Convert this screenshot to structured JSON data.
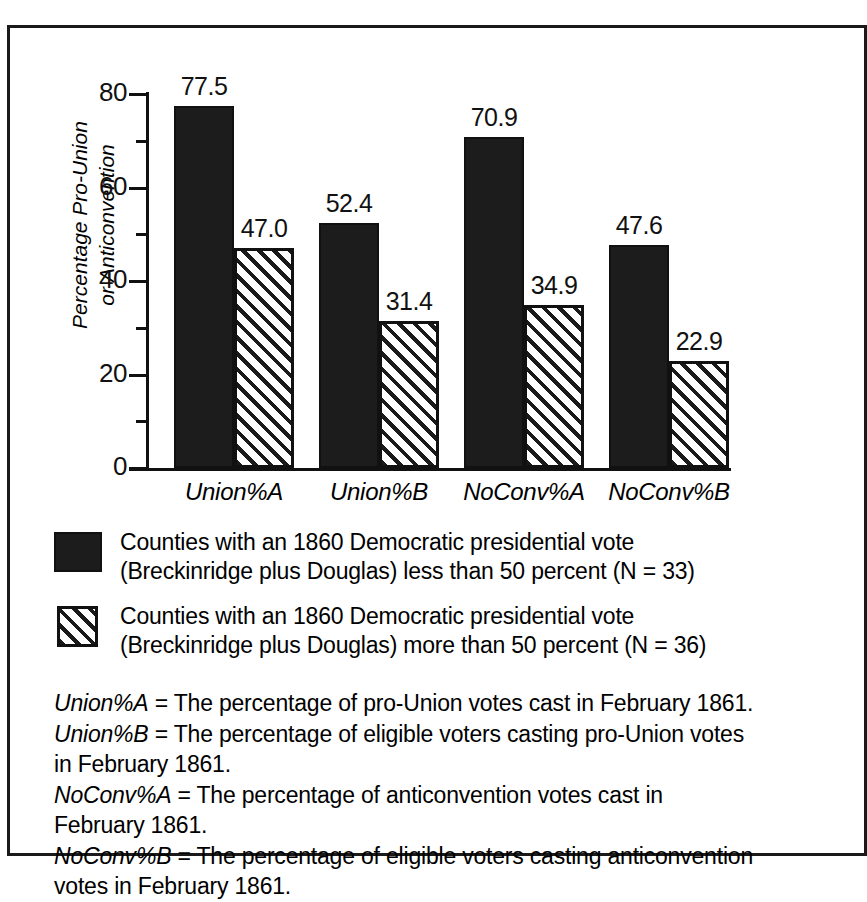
{
  "chart_data": {
    "type": "bar",
    "title": "",
    "xlabel": "",
    "ylabel": "Percentage Pro-Union or Anticonvention",
    "ylim": [
      0,
      80
    ],
    "ytick_values": [
      0,
      20,
      40,
      60,
      80
    ],
    "yticks": [
      "0",
      "20",
      "40",
      "60",
      "80"
    ],
    "yminor_ticks": [
      10,
      30,
      50,
      70
    ],
    "grid": false,
    "legend_position": "below-plot",
    "categories": [
      "Union%A",
      "Union%B",
      "NoConv%A",
      "NoConv%B"
    ],
    "series": [
      {
        "name": "Counties with an 1860 Democratic presidential vote (Breckinridge plus Douglas) less than 50 percent (N = 33)",
        "fill": "solid-black",
        "values": [
          77.5,
          52.4,
          70.9,
          47.6
        ],
        "labels": [
          "77.5",
          "52.4",
          "70.9",
          "47.6"
        ]
      },
      {
        "name": "Counties with an 1860 Democratic presidential vote (Breckinridge plus Douglas) more than 50 percent (N = 36)",
        "fill": "diagonal-hatch",
        "values": [
          47.0,
          31.4,
          34.9,
          22.9
        ],
        "labels": [
          "47.0",
          "31.4",
          "34.9",
          "22.9"
        ]
      }
    ]
  },
  "axis": {
    "y_title_line1": "Percentage Pro-Union",
    "y_title_line2": "or Anticonvention"
  },
  "legend": {
    "items": [
      {
        "swatch": "solid-black",
        "line1": "Counties with an 1860 Democratic presidential vote (Breckinridge plus",
        "line2": "Douglas) less than 50 percent (N = 33)"
      },
      {
        "swatch": "diagonal-hatch",
        "line1": "Counties with an 1860 Democratic presidential vote (Breckinridge plus",
        "line2": "Douglas) more than 50 percent (N = 36)"
      }
    ]
  },
  "definitions": [
    {
      "term": "Union%A",
      "text": " = The percentage of pro-Union votes cast in February 1861."
    },
    {
      "term": "Union%B",
      "text": " = The percentage of eligible voters casting pro-Union votes in February 1861."
    },
    {
      "term": "NoConv%A",
      "text": " = The percentage of anticonvention votes cast in February 1861."
    },
    {
      "term": "NoConv%B",
      "text": " = The percentage of eligible voters casting anticonvention votes in February 1861."
    }
  ],
  "colors": {
    "series_1": "#1c1c1c",
    "series_2_hatch": "#1a1a1a",
    "axis": "#111111",
    "background": "#ffffff"
  }
}
